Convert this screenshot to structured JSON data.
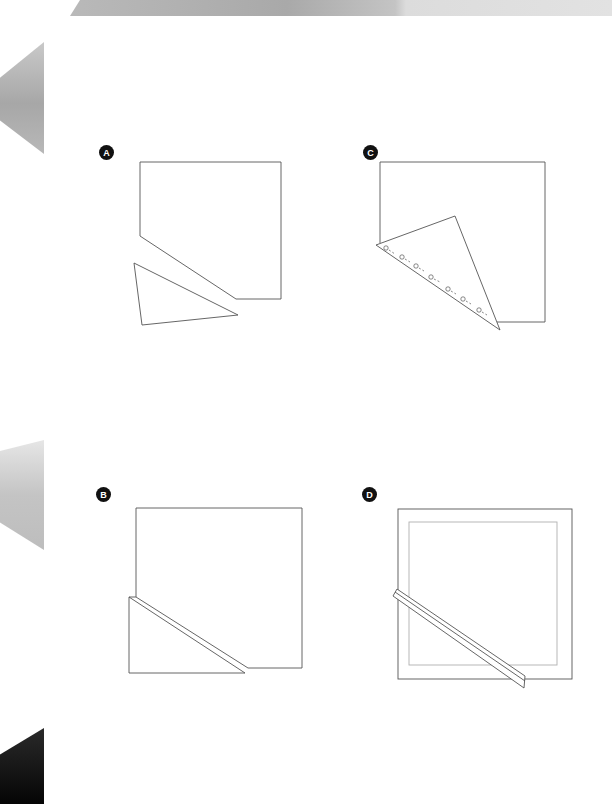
{
  "figure": {
    "panels": [
      {
        "id": "A",
        "label": "A"
      },
      {
        "id": "B",
        "label": "B"
      },
      {
        "id": "C",
        "label": "C"
      },
      {
        "id": "D",
        "label": "D"
      }
    ]
  },
  "colors": {
    "stroke": "#555555",
    "inner_stroke": "#b0b0b0",
    "marker_bg": "#111111",
    "marker_text": "#ffffff"
  }
}
